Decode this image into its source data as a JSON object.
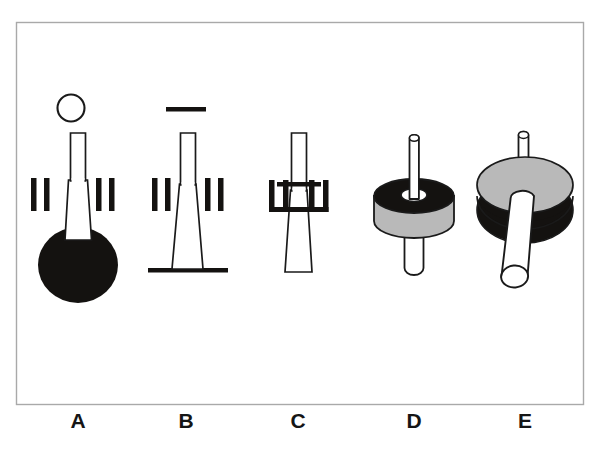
{
  "figure": {
    "name": "schematic-panel-a-to-e",
    "background_color": "#ffffff",
    "border": {
      "name": "figure-border",
      "x": 16,
      "y": 22,
      "width": 567,
      "height": 382,
      "stroke_color": "#a9a9a9",
      "stroke_width": 1.4
    },
    "ink_color": "#1a1a1a",
    "fill_black": "#141210",
    "fill_gray": "#b9b9b9",
    "fill_white": "#ffffff",
    "panels": [
      {
        "id": "A",
        "label": "A",
        "label_x": 78,
        "label_y": 428,
        "center_x": 78,
        "description": "open circle head on narrow stalk flaring into a trapezoid body over a large solid black disc, flanked by two pairs of vertical tick marks",
        "parts": [
          {
            "name": "head-circle-outline",
            "shape": "circle",
            "fill": "white",
            "stroke": "black"
          },
          {
            "name": "stalk-neck",
            "shape": "outline-column",
            "fill": "white",
            "stroke": "black"
          },
          {
            "name": "flared-body",
            "shape": "outline-trapezoid",
            "fill": "white",
            "stroke": "black"
          },
          {
            "name": "basal-disc",
            "shape": "filled-circle",
            "fill": "black",
            "stroke": "none"
          },
          {
            "name": "tick-marks",
            "count": 4,
            "fill": "black",
            "arrangement": "two-left-two-right"
          }
        ]
      },
      {
        "id": "B",
        "label": "B",
        "label_x": 186,
        "label_y": 428,
        "center_x": 186,
        "description": "solid horizontal bar above a narrow stalk flaring into a trapezoid body resting on a horizontal base line, flanked by two pairs of vertical tick marks",
        "parts": [
          {
            "name": "head-bar",
            "shape": "filled-rect",
            "fill": "black",
            "stroke": "none"
          },
          {
            "name": "stalk-neck",
            "shape": "outline-column",
            "fill": "white",
            "stroke": "black"
          },
          {
            "name": "flared-body",
            "shape": "outline-trapezoid",
            "fill": "white",
            "stroke": "black"
          },
          {
            "name": "base-line",
            "shape": "filled-rect",
            "fill": "black",
            "stroke": "none"
          },
          {
            "name": "tick-marks",
            "count": 4,
            "fill": "black",
            "arrangement": "two-left-two-right"
          }
        ]
      },
      {
        "id": "C",
        "label": "C",
        "label_x": 298,
        "label_y": 428,
        "center_x": 298,
        "description": "narrow stalk through a horizontal plate flaring into a trapezoid body, flanked by two bracketed comb groups of tick marks joined by horizontal bars",
        "parts": [
          {
            "name": "stalk-neck",
            "shape": "outline-column",
            "fill": "white",
            "stroke": "black"
          },
          {
            "name": "cross-plate",
            "shape": "filled-rect",
            "fill": "black",
            "stroke": "none"
          },
          {
            "name": "flared-body",
            "shape": "outline-trapezoid",
            "fill": "white",
            "stroke": "black"
          },
          {
            "name": "comb-left",
            "shape": "bracket-comb",
            "teeth": 2,
            "fill": "black"
          },
          {
            "name": "comb-right",
            "shape": "bracket-comb",
            "teeth": 2,
            "fill": "black"
          }
        ]
      },
      {
        "id": "D",
        "label": "D",
        "label_x": 414,
        "label_y": 428,
        "center_x": 414,
        "description": "three-dimensional disc with black top face and gray cylindrical rim, pierced by a thin rod above and a thick rod below",
        "parts": [
          {
            "name": "upper-rod",
            "shape": "thin-cylinder",
            "fill": "white",
            "stroke": "black"
          },
          {
            "name": "disc-top-face",
            "shape": "ellipse",
            "fill": "black",
            "stroke": "black"
          },
          {
            "name": "disc-rim",
            "shape": "cylinder-wall",
            "fill": "gray",
            "stroke": "black"
          },
          {
            "name": "center-hole",
            "shape": "ellipse",
            "fill": "white",
            "stroke": "black"
          },
          {
            "name": "lower-rod",
            "shape": "thick-cylinder",
            "fill": "white",
            "stroke": "black"
          }
        ]
      },
      {
        "id": "E",
        "label": "E",
        "label_x": 525,
        "label_y": 428,
        "center_x": 525,
        "description": "three-dimensional disc viewed from above with gray top face and black lower body, thin rod rising from the top and a thick rod emerging toward the viewer",
        "parts": [
          {
            "name": "upper-rod",
            "shape": "thin-cylinder",
            "fill": "white",
            "stroke": "black"
          },
          {
            "name": "disc-lower-body",
            "shape": "ellipse",
            "fill": "black",
            "stroke": "black"
          },
          {
            "name": "disc-top-face",
            "shape": "ellipse",
            "fill": "gray",
            "stroke": "black"
          },
          {
            "name": "front-rod",
            "shape": "thick-cylinder-angled",
            "fill": "white",
            "stroke": "black"
          }
        ]
      }
    ]
  }
}
